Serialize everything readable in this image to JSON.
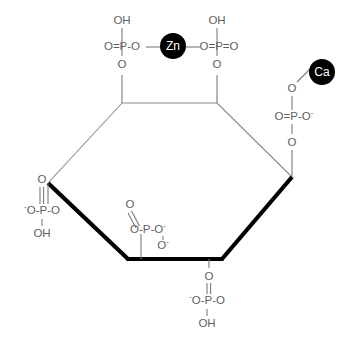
{
  "diagram": {
    "background_color": "#ffffff",
    "bond_thin_color": "#8c8c8c",
    "bond_bold_color": "#000000",
    "label_color": "#5f5f5f",
    "metal_disc_color": "#000000",
    "metal_text_color": "#ffffff"
  },
  "metals": [
    {
      "id": "zinc",
      "label": "Zn",
      "cx": 173,
      "cy": 46,
      "r": 13
    },
    {
      "id": "calcium",
      "label": "Ca",
      "cx": 322,
      "cy": 72,
      "r": 13
    }
  ],
  "ring": {
    "name": "inositol-hexagon",
    "vertices": [
      {
        "id": "c1",
        "x": 122,
        "y": 103
      },
      {
        "id": "c2",
        "x": 217,
        "y": 103
      },
      {
        "id": "c3",
        "x": 292,
        "y": 177
      },
      {
        "id": "c4",
        "x": 222,
        "y": 259
      },
      {
        "id": "c5",
        "x": 128,
        "y": 259
      },
      {
        "id": "c6",
        "x": 48,
        "y": 183
      }
    ],
    "edges": [
      {
        "from": "c1",
        "to": "c2",
        "weight": "thin"
      },
      {
        "from": "c2",
        "to": "c3",
        "weight": "thin"
      },
      {
        "from": "c3",
        "to": "c4",
        "weight": "bold"
      },
      {
        "from": "c4",
        "to": "c5",
        "weight": "bold"
      },
      {
        "from": "c5",
        "to": "c6",
        "weight": "bold"
      },
      {
        "from": "c6",
        "to": "c1",
        "weight": "thin"
      }
    ]
  },
  "phosphates": [
    {
      "id": "phosphate-top-left",
      "attached_to": "c1",
      "core": "O=P-O",
      "top_label": "OH",
      "bottom_label": "O",
      "bonded_metal": "zinc"
    },
    {
      "id": "phosphate-top-right",
      "attached_to": "c2",
      "core": "O=P=O",
      "top_label": "OH",
      "bottom_label": "O",
      "bonded_metal": "zinc"
    },
    {
      "id": "phosphate-right",
      "attached_to": "c3",
      "core": "O=P-O",
      "core_right_charge": "-",
      "top_label": "O",
      "bottom_label": "O",
      "bonded_metal": "calcium"
    },
    {
      "id": "phosphate-left",
      "attached_to": "c6",
      "core": "O-P-O",
      "core_left_charge": "-",
      "top_label": "O",
      "bottom_label": "OH",
      "bonded_metal": null
    },
    {
      "id": "phosphate-bottom-left",
      "attached_to": "c5",
      "core": "O-P-O",
      "core_right_charge": "-",
      "top_label": "O",
      "extra_label": "O",
      "extra_charge": "-",
      "bonded_metal": null
    },
    {
      "id": "phosphate-bottom",
      "attached_to": "c4",
      "core": "O-P-O",
      "core_left_charge": "-",
      "top_label": "O",
      "bottom_label": "OH",
      "bonded_metal": null
    }
  ],
  "atom_labels": {
    "oh": "OH",
    "o": "O",
    "p": "P",
    "minus": "-",
    "eq": "=",
    "dash": "-"
  }
}
